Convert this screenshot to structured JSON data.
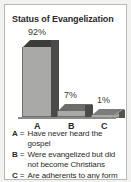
{
  "card": {
    "title": "Status of Evangelization"
  },
  "chart_data": {
    "type": "bar",
    "title": "Status of Evangelization",
    "xlabel": "",
    "ylabel": "",
    "ylim": [
      0,
      100
    ],
    "grid": false,
    "legend_position": "below",
    "categories": [
      "A",
      "B",
      "C"
    ],
    "values": [
      92,
      7,
      1
    ],
    "value_labels": [
      "92%",
      "7%",
      "1%"
    ],
    "category_descriptions": [
      "Have never heard the gospel",
      "Were evangelized but did not become Christians",
      "Are adherents to any form of Christianity"
    ],
    "colors": {
      "bar_front": "#a9a9a7",
      "bar_side": "#4a4a48",
      "bar_top": "#3d3d3b",
      "axis": "#8a8a88",
      "text": "#2b2b2b",
      "card_background": "#ffffff",
      "page_background": "#f2f2f0",
      "card_border": "#b8b8b4"
    }
  },
  "legend": {
    "equals": "=",
    "items": [
      {
        "key": "A",
        "text": "Have never heard the gospel"
      },
      {
        "key": "B",
        "text": "Were evangelized but did not become Christians"
      },
      {
        "key": "C",
        "text": "Are adherents to any form of Christianity"
      }
    ]
  }
}
